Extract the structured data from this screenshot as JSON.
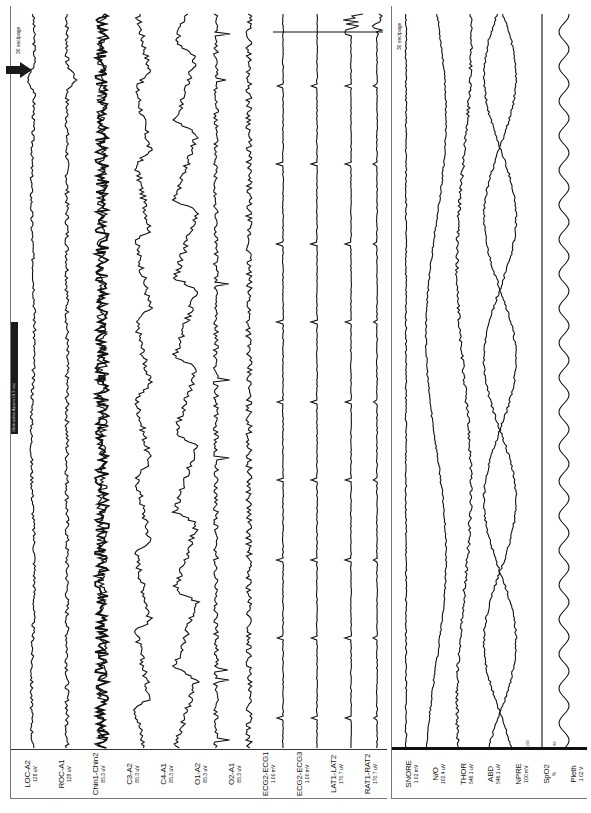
{
  "viewer": {
    "page_scale_left": "30 sec/page",
    "page_scale_right": "30 sec/page",
    "annotation_bar_text": "Obstructive Apnea 18.3 sec",
    "event_marker": "arrow-marker"
  },
  "left_channels": [
    {
      "name": "LOC-A2",
      "gain": "128 uV"
    },
    {
      "name": "ROC-A1",
      "gain": "128 uV"
    },
    {
      "name": "Chin1-Chin2",
      "gain": "85.3 uV"
    },
    {
      "name": "C3-A2",
      "gain": "85.3 uV"
    },
    {
      "name": "C4-A1",
      "gain": "85.3 uV"
    },
    {
      "name": "O1-A2",
      "gain": "85.3 uV"
    },
    {
      "name": "O2-A1",
      "gain": "85.3 uV"
    },
    {
      "name": "ECG2-ECG1",
      "gain": "1.00 mV"
    },
    {
      "name": "ECG2-ECG3",
      "gain": "1.00 mV"
    },
    {
      "name": "LAT1-LAT2",
      "gain": "170.7 uV"
    },
    {
      "name": "RAT1-RAT2",
      "gain": "170.7 uV"
    }
  ],
  "right_channels": [
    {
      "name": "SNORE",
      "gain": "1.02 mV"
    },
    {
      "name": "N/O",
      "gain": "102.4 uV"
    },
    {
      "name": "THOR",
      "gain": "546.1 uV"
    },
    {
      "name": "ABD",
      "gain": "546.1 uV"
    },
    {
      "name": "NPRE",
      "gain": "100 mV"
    },
    {
      "name": "SpO2",
      "gain": "%"
    },
    {
      "name": "Pleth",
      "gain": "1.02 V"
    }
  ],
  "spo2_scale": {
    "max": "100",
    "min": "80"
  },
  "colors": {
    "trace": "#111111",
    "background": "#ffffff",
    "border": "#777777",
    "annotation": "#1a1a1a"
  }
}
